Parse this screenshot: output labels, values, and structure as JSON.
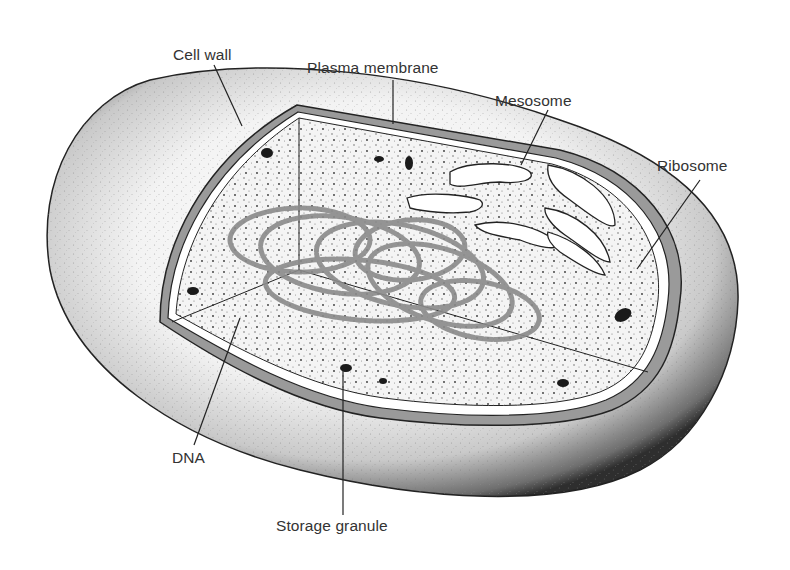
{
  "diagram": {
    "style": "stippled black-and-white illustration, cutaway view",
    "colors": {
      "background": "#ffffff",
      "ink": "#1a1a1a",
      "label_text": "#333333",
      "cytoplasm": "#f4f4f4",
      "dna_strand": "#8a8a8a",
      "wall_band": "#9a9a9a"
    },
    "labels": [
      {
        "id": "cell-wall",
        "text": "Cell wall"
      },
      {
        "id": "plasma-membrane",
        "text": "Plasma membrane"
      },
      {
        "id": "mesosome",
        "text": "Mesosome"
      },
      {
        "id": "ribosome",
        "text": "Ribosome"
      },
      {
        "id": "dna",
        "text": "DNA"
      },
      {
        "id": "storage-granule",
        "text": "Storage granule"
      }
    ]
  }
}
